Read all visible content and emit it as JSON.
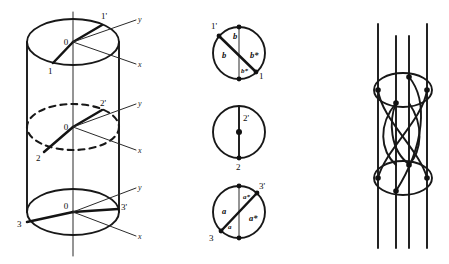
{
  "figure": {
    "background_color": "#ffffff",
    "line_color": "#181818"
  },
  "panel_left": {
    "name": "cylinder-diagram",
    "description": "Vertical cylinder with three horizontal cross-section ellipses and local x/y axes",
    "vertical_axis_label": "",
    "sections": [
      {
        "name": "top-section",
        "center_label": "0",
        "point_prime_label": "1'",
        "point_label": "1",
        "axis_y_label": "y",
        "axis_x_label": "x",
        "line_style": "solid"
      },
      {
        "name": "middle-section",
        "center_label": "0",
        "point_prime_label": "2'",
        "point_label": "2",
        "axis_y_label": "y",
        "axis_x_label": "x",
        "line_style": "dashed"
      },
      {
        "name": "bottom-section",
        "center_label": "0",
        "point_prime_label": "3'",
        "point_label": "3",
        "axis_y_label": "y",
        "axis_x_label": "x",
        "line_style": "solid"
      }
    ]
  },
  "panel_middle": {
    "name": "circle-diagrams",
    "circles": [
      {
        "name": "circle-top",
        "point_prime_label": "1'",
        "point_label": "1",
        "arc_labels": [
          {
            "text": "b",
            "position": "upper-middle"
          },
          {
            "text": "b",
            "position": "left"
          },
          {
            "text": "b*",
            "position": "right"
          },
          {
            "text": "b*",
            "position": "lower-middle"
          }
        ]
      },
      {
        "name": "circle-middle",
        "point_prime_label": "2'",
        "point_label": "2",
        "arc_labels": []
      },
      {
        "name": "circle-bottom",
        "point_prime_label": "3'",
        "point_label": "3",
        "arc_labels": [
          {
            "text": "a*",
            "position": "upper-middle"
          },
          {
            "text": "a",
            "position": "left"
          },
          {
            "text": "a*",
            "position": "right"
          },
          {
            "text": "a",
            "position": "lower-middle"
          }
        ]
      }
    ]
  },
  "panel_right": {
    "name": "braid-diagram",
    "description": "Four vertical strands with two ellipses and crossing arcs",
    "strand_count": 4,
    "ellipse_count": 2,
    "node_count": 8
  }
}
